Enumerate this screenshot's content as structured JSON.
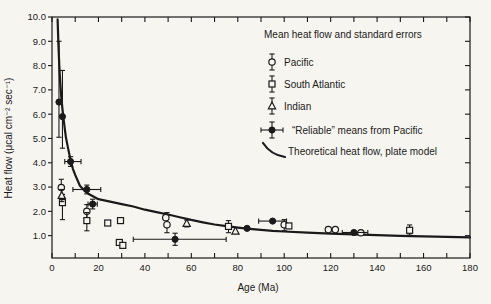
{
  "chart_data": {
    "type": "scatter",
    "title": "",
    "xlabel": "Age (Ma)",
    "ylabel": "Heat flow (μcal cm⁻² sec⁻¹)",
    "xlim": [
      0,
      180
    ],
    "ylim": [
      0.08,
      10.0
    ],
    "x_ticks_major": [
      0,
      20,
      40,
      60,
      80,
      100,
      120,
      140,
      160,
      180
    ],
    "x_tick_minor_step": 10,
    "y_ticks": [
      1.0,
      2.0,
      3.0,
      4.0,
      5.0,
      6.0,
      7.0,
      8.0,
      9.0,
      10.0
    ],
    "grid": false,
    "frame": "full-box",
    "colors": {
      "ink": "#1a1a1a",
      "paper": "#f7f5f0"
    },
    "legend": {
      "title": "Mean heat flow and standard errors",
      "items": [
        {
          "label": "Pacific",
          "symbol": "open-circle"
        },
        {
          "label": "South Atlantic",
          "symbol": "open-square"
        },
        {
          "label": "Indian",
          "symbol": "open-triangle"
        },
        {
          "label": "“Reliable” means from Pacific",
          "symbol": "reliable-mean"
        },
        {
          "label": "Theoretical heat flow, plate model",
          "symbol": "curve"
        }
      ]
    },
    "series": [
      {
        "id": "pacific",
        "name": "Pacific",
        "symbol": "open-circle",
        "points": [
          {
            "x": 4,
            "y": 2.98,
            "yerr": [
              2.6,
              3.32
            ]
          },
          {
            "x": 15,
            "y": 2.0,
            "yerr": [
              1.72,
              2.28
            ]
          },
          {
            "x": 49,
            "y": 1.74
          },
          {
            "x": 49.5,
            "y": 1.45,
            "yerr": [
              1.12,
              1.95
            ]
          },
          {
            "x": 100,
            "y": 1.45,
            "yerr": [
              1.2,
              1.66
            ]
          },
          {
            "x": 119,
            "y": 1.25
          },
          {
            "x": 122,
            "y": 1.25
          },
          {
            "x": 133,
            "y": 1.12
          }
        ]
      },
      {
        "id": "south-atlantic",
        "name": "South Atlantic",
        "symbol": "open-square",
        "points": [
          {
            "x": 4.5,
            "y": 2.36,
            "yerr": [
              1.66,
              2.7
            ]
          },
          {
            "x": 15,
            "y": 1.62,
            "yerr": [
              1.2,
              1.95
            ]
          },
          {
            "x": 24,
            "y": 1.52
          },
          {
            "x": 29.5,
            "y": 1.62
          },
          {
            "x": 29,
            "y": 0.72
          },
          {
            "x": 30.5,
            "y": 0.6
          },
          {
            "x": 76,
            "y": 1.38,
            "yerr": [
              1.12,
              1.62
            ]
          },
          {
            "x": 102,
            "y": 1.4
          },
          {
            "x": 154,
            "y": 1.22,
            "yerr": [
              1.02,
              1.44
            ]
          }
        ]
      },
      {
        "id": "indian",
        "name": "Indian",
        "symbol": "open-triangle",
        "points": [
          {
            "x": 4.2,
            "y": 2.65,
            "yerr": [
              2.4,
              2.9
            ]
          },
          {
            "x": 58,
            "y": 1.5,
            "yerr": [
              1.36,
              1.64
            ]
          },
          {
            "x": 79,
            "y": 1.18
          }
        ]
      },
      {
        "id": "reliable-pacific",
        "name": "“Reliable” means from Pacific",
        "symbol": "filled-circle",
        "points": [
          {
            "x": 3,
            "y": 6.5,
            "yerr": [
              5.05,
              9.0
            ]
          },
          {
            "x": 4.5,
            "y": 5.9,
            "yerr": [
              4.6,
              7.8
            ]
          },
          {
            "x": 8,
            "y": 4.05,
            "xerr": [
              5.5,
              12.5
            ],
            "yerr": [
              3.85,
              4.25
            ]
          },
          {
            "x": 15,
            "y": 2.9,
            "xerr": [
              9,
              21
            ],
            "yerr": [
              2.72,
              3.08
            ]
          },
          {
            "x": 17.5,
            "y": 2.3,
            "xerr": [
              15.5,
              19.5
            ],
            "yerr": [
              2.1,
              2.5
            ]
          },
          {
            "x": 53,
            "y": 0.85,
            "xerr": [
              35,
              75
            ],
            "yerr": [
              0.6,
              1.1
            ]
          },
          {
            "x": 84,
            "y": 1.3
          },
          {
            "x": 95,
            "y": 1.6,
            "xerr": [
              89,
              101
            ]
          },
          {
            "x": 130,
            "y": 1.13,
            "xerr": [
              125,
              136
            ]
          }
        ]
      }
    ],
    "curve": {
      "name": "Theoretical heat flow, plate model",
      "points": [
        [
          2.4,
          9.9
        ],
        [
          2.8,
          8.8
        ],
        [
          3.2,
          7.9
        ],
        [
          3.6,
          7.2
        ],
        [
          4.0,
          6.7
        ],
        [
          4.5,
          6.2
        ],
        [
          5.0,
          5.8
        ],
        [
          5.5,
          5.4
        ],
        [
          6.0,
          5.05
        ],
        [
          7.0,
          4.55
        ],
        [
          8.0,
          4.1
        ],
        [
          9.0,
          3.75
        ],
        [
          10,
          3.5
        ],
        [
          12,
          3.05
        ],
        [
          14,
          2.85
        ],
        [
          16,
          2.7
        ],
        [
          18,
          2.6
        ],
        [
          20,
          2.5
        ],
        [
          25,
          2.4
        ],
        [
          30,
          2.3
        ],
        [
          35,
          2.2
        ],
        [
          40,
          2.07
        ],
        [
          45,
          1.97
        ],
        [
          50,
          1.87
        ],
        [
          55,
          1.76
        ],
        [
          60,
          1.65
        ],
        [
          65,
          1.55
        ],
        [
          70,
          1.46
        ],
        [
          75,
          1.39
        ],
        [
          80,
          1.33
        ],
        [
          85,
          1.28
        ],
        [
          90,
          1.24
        ],
        [
          95,
          1.2
        ],
        [
          100,
          1.17
        ],
        [
          110,
          1.12
        ],
        [
          120,
          1.08
        ],
        [
          130,
          1.05
        ],
        [
          140,
          1.02
        ],
        [
          150,
          0.99
        ],
        [
          160,
          0.97
        ],
        [
          170,
          0.95
        ],
        [
          180,
          0.93
        ]
      ]
    },
    "layout": {
      "plot_box": {
        "left": 52,
        "top": 17,
        "right": 470,
        "bottom": 258
      },
      "legend_pos": {
        "title_x": 264,
        "title_y": 38,
        "symbol_x": 272,
        "label_x": 284,
        "item_ys": [
          62,
          84,
          106,
          130,
          151
        ]
      },
      "xlabel_pos": [
        258,
        291
      ],
      "ylabel_pos": [
        12,
        138
      ]
    }
  }
}
